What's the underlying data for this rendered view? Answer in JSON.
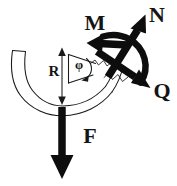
{
  "figure": {
    "kind": "hand-drawn engineering sketch",
    "background_color": "#ffffff",
    "ink_color": "#0d0d0d",
    "width": 177,
    "height": 186
  },
  "labels": {
    "moment": "M",
    "normal_force": "N",
    "shear_force": "Q",
    "applied_force": "F",
    "radius": "R",
    "angle": "φ"
  },
  "annotations": [
    {
      "id": "moment",
      "symbol": "M",
      "meaning": "bending moment",
      "arrow": "left-pointing thick arrow",
      "label_x": 95,
      "label_y": 30
    },
    {
      "id": "normal-force",
      "symbol": "N",
      "meaning": "normal force",
      "arrow": "up-right diagonal thick arrow",
      "label_x": 150,
      "label_y": 22
    },
    {
      "id": "shear-force",
      "symbol": "Q",
      "meaning": "shear force",
      "arrow": "down-right diagonal thick arrow",
      "label_x": 152,
      "label_y": 98
    },
    {
      "id": "applied-force",
      "symbol": "F",
      "meaning": "applied load",
      "arrow": "downward thick arrow",
      "label_x": 84,
      "label_y": 143
    },
    {
      "id": "radius",
      "symbol": "R",
      "meaning": "radius of curvature",
      "arrow": "vertical double-ended dimension arrow",
      "label_x": 52,
      "label_y": 74
    },
    {
      "id": "angle",
      "symbol": "φ",
      "meaning": "angular position",
      "arrow": "curved arc arrow inside wedge",
      "label_x": 79,
      "label_y": 68
    }
  ],
  "geometry": {
    "cut_point_x": 118,
    "cut_point_y": 58,
    "arc_center_x": 62,
    "arc_center_y": 52,
    "arc_bottom_x": 62,
    "arc_bottom_y": 101
  }
}
